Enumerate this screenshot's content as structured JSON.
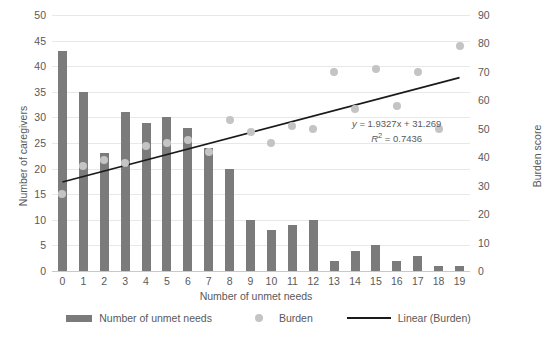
{
  "chart_data": {
    "type": "bar",
    "title": "",
    "xlabel": "Number of unmet needs",
    "ylabel": "Number of caregivers",
    "y2label": "Burden score",
    "categories": [
      0,
      1,
      2,
      3,
      4,
      5,
      6,
      7,
      8,
      9,
      10,
      11,
      12,
      13,
      14,
      15,
      16,
      17,
      18,
      19
    ],
    "xlim": [
      0,
      19
    ],
    "ylim": [
      0,
      50
    ],
    "y2lim": [
      0,
      90
    ],
    "yticks": [
      0,
      5,
      10,
      15,
      20,
      25,
      30,
      35,
      40,
      45,
      50
    ],
    "y2ticks": [
      0,
      10,
      20,
      30,
      40,
      50,
      60,
      70,
      80,
      90
    ],
    "grid": true,
    "legend_position": "bottom",
    "series": [
      {
        "name": "Number of unmet needs",
        "kind": "bar",
        "axis": "left",
        "color": "#7b7b7b",
        "values": [
          43,
          35,
          23,
          31,
          29,
          30,
          28,
          24,
          20,
          10,
          8,
          9,
          10,
          2,
          4,
          5,
          2,
          3,
          1,
          1
        ]
      },
      {
        "name": "Burden",
        "kind": "scatter",
        "axis": "right",
        "color": "#c4c4c4",
        "values": [
          27,
          37,
          39,
          38,
          44,
          45,
          46,
          42,
          53,
          49,
          45,
          51,
          50,
          70,
          57,
          71,
          58,
          70,
          50,
          79
        ]
      },
      {
        "name": "Linear (Burden)",
        "kind": "line",
        "axis": "right",
        "color": "#1a1a1a",
        "slope": 1.9327,
        "intercept": 31.269,
        "r_squared": 0.7436
      }
    ],
    "annotations": {
      "equation": "y = 1.9327x + 31.269",
      "equation_lhs": "y",
      "equation_rhs": "= 1.9327x + 31.269",
      "r2_label": "R",
      "r2_exponent": "2",
      "r2_value": "= 0.7436"
    }
  },
  "legend": {
    "items": [
      {
        "label": "Number of unmet needs",
        "marker": "bar-swatch"
      },
      {
        "label": "Burden",
        "marker": "dot-swatch"
      },
      {
        "label": "Linear (Burden)",
        "marker": "line-swatch"
      }
    ]
  },
  "colors": {
    "bar": "#7b7b7b",
    "dot": "#c4c4c4",
    "trendline": "#1a1a1a",
    "gridline": "#e8e8e8",
    "text": "#595959",
    "background": "#ffffff"
  }
}
